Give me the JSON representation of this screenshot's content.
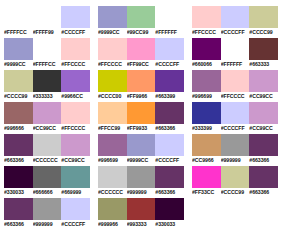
{
  "chart_data": {
    "type": "table",
    "title": "",
    "xlabel": "",
    "ylabel": "",
    "layout": {
      "columns": 3,
      "rows_per_column": [
        7,
        7,
        6
      ],
      "swatches_per_row": 3,
      "grid": true,
      "legend": "none"
    },
    "categories": [
      "column-1",
      "column-2",
      "column-3"
    ]
  },
  "palette": {
    "columns": [
      {
        "name": "column-1",
        "rows": [
          {
            "swatches": [
              {
                "hex": "#FFFFCC",
                "label": "#FFFFCC",
                "visible": false
              },
              {
                "hex": "#FFFF99",
                "label": "#FFFF99",
                "visible": false
              },
              {
                "hex": "#CCCCFF",
                "label": "#CCCCFF",
                "visible": true
              }
            ]
          },
          {
            "swatches": [
              {
                "hex": "#9999CC",
                "label": "#9999CC",
                "visible": true
              },
              {
                "hex": "#FFFFCC",
                "label": "#FFFFCC",
                "visible": false
              },
              {
                "hex": "#FFCCCC",
                "label": "#FFCCCC",
                "visible": true
              }
            ]
          },
          {
            "swatches": [
              {
                "hex": "#CCCC99",
                "label": "#CCCC99",
                "visible": true
              },
              {
                "hex": "#333333",
                "label": "#333333",
                "visible": true
              },
              {
                "hex": "#9966CC",
                "label": "#9966CC",
                "visible": true
              }
            ]
          },
          {
            "swatches": [
              {
                "hex": "#996666",
                "label": "#996666",
                "visible": true
              },
              {
                "hex": "#CC99CC",
                "label": "#CC99CC",
                "visible": true
              },
              {
                "hex": "#FFCCCC",
                "label": "#FFCCCC",
                "visible": true
              }
            ]
          },
          {
            "swatches": [
              {
                "hex": "#663366",
                "label": "#663366",
                "visible": true
              },
              {
                "hex": "#CCCCCC",
                "label": "#CCCCCC",
                "visible": true
              },
              {
                "hex": "#CC99CC",
                "label": "#CC99CC",
                "visible": true
              }
            ]
          },
          {
            "swatches": [
              {
                "hex": "#330033",
                "label": "#330033",
                "visible": true
              },
              {
                "hex": "#666666",
                "label": "#666666",
                "visible": true
              },
              {
                "hex": "#669999",
                "label": "#669999",
                "visible": true
              }
            ]
          },
          {
            "swatches": [
              {
                "hex": "#663366",
                "label": "#663366",
                "visible": true
              },
              {
                "hex": "#999999",
                "label": "#999999",
                "visible": true
              },
              {
                "hex": "#CCCCFF",
                "label": "#CCCCFF",
                "visible": true
              }
            ]
          }
        ]
      },
      {
        "name": "column-2",
        "rows": [
          {
            "swatches": [
              {
                "hex": "#9999CC",
                "label": "#9999CC",
                "visible": true
              },
              {
                "hex": "#99CC99",
                "label": "#99CC99",
                "visible": true
              },
              {
                "hex": "#FFFFFF",
                "label": "#FFFFFF",
                "visible": false
              }
            ]
          },
          {
            "swatches": [
              {
                "hex": "#FFCCCC",
                "label": "#FFCCCC",
                "visible": true
              },
              {
                "hex": "#FF99CC",
                "label": "#FF99CC",
                "visible": true
              },
              {
                "hex": "#CCCCFF",
                "label": "#CCCCFF",
                "visible": true
              }
            ]
          },
          {
            "swatches": [
              {
                "hex": "#CCCC00",
                "label": "#CCCC00",
                "visible": true
              },
              {
                "hex": "#FF9966",
                "label": "#FF9966",
                "visible": true
              },
              {
                "hex": "#663399",
                "label": "#663399",
                "visible": true
              }
            ]
          },
          {
            "swatches": [
              {
                "hex": "#FFCC99",
                "label": "#FFCC99",
                "visible": true
              },
              {
                "hex": "#FF9933",
                "label": "#FF9933",
                "visible": true
              },
              {
                "hex": "#663366",
                "label": "#663366",
                "visible": true
              }
            ]
          },
          {
            "swatches": [
              {
                "hex": "#996699",
                "label": "#996699",
                "visible": true
              },
              {
                "hex": "#9999CC",
                "label": "#9999CC",
                "visible": true
              },
              {
                "hex": "#CCCCFF",
                "label": "#CCCCFF",
                "visible": true
              }
            ]
          },
          {
            "swatches": [
              {
                "hex": "#CCCCCC",
                "label": "#CCCCCC",
                "visible": true
              },
              {
                "hex": "#999999",
                "label": "#999999",
                "visible": true
              },
              {
                "hex": "#663366",
                "label": "#663366",
                "visible": true
              }
            ]
          },
          {
            "swatches": [
              {
                "hex": "#999966",
                "label": "#999966",
                "visible": true
              },
              {
                "hex": "#993333",
                "label": "#993333",
                "visible": true
              },
              {
                "hex": "#330033",
                "label": "#330033",
                "visible": true
              }
            ]
          }
        ]
      },
      {
        "name": "column-3",
        "rows": [
          {
            "swatches": [
              {
                "hex": "#FFCCCC",
                "label": "#FFCCCC",
                "visible": true
              },
              {
                "hex": "#CCCCFF",
                "label": "#CCCCFF",
                "visible": true
              },
              {
                "hex": "#CCCC99",
                "label": "#CCCC99",
                "visible": true
              }
            ]
          },
          {
            "swatches": [
              {
                "hex": "#660066",
                "label": "#660066",
                "visible": true
              },
              {
                "hex": "#FFFFFF",
                "label": "#FFFFFF",
                "visible": false
              },
              {
                "hex": "#663333",
                "label": "#663333",
                "visible": true
              }
            ]
          },
          {
            "swatches": [
              {
                "hex": "#996699",
                "label": "#996699",
                "visible": true
              },
              {
                "hex": "#FFCCCC",
                "label": "#FFCCCC",
                "visible": true
              },
              {
                "hex": "#CC99CC",
                "label": "#CC99CC",
                "visible": true
              }
            ]
          },
          {
            "swatches": [
              {
                "hex": "#333399",
                "label": "#333399",
                "visible": true
              },
              {
                "hex": "#CCCCFF",
                "label": "#CCCCFF",
                "visible": true
              },
              {
                "hex": "#CC99CC",
                "label": "#CC99CC",
                "visible": true
              }
            ]
          },
          {
            "swatches": [
              {
                "hex": "#CC9966",
                "label": "#CC9966",
                "visible": true
              },
              {
                "hex": "#999999",
                "label": "#999999",
                "visible": true
              },
              {
                "hex": "#663366",
                "label": "#663366",
                "visible": true
              }
            ]
          },
          {
            "swatches": [
              {
                "hex": "#FF33CC",
                "label": "#FF33CC",
                "visible": true
              },
              {
                "hex": "#CCCC99",
                "label": "#CCCC99",
                "visible": true
              },
              {
                "hex": "#663366",
                "label": "#663366",
                "visible": true
              }
            ]
          }
        ]
      }
    ]
  }
}
